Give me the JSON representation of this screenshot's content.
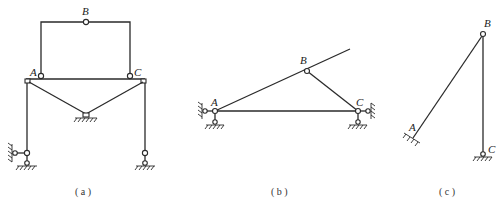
{
  "figures": [
    {
      "id": "a",
      "caption": "( a )",
      "labels": {
        "A": "A",
        "B": "B",
        "C": "C"
      },
      "description": "Frame with upper three-hinged arch on beam, two diagonal struts to central pin support, two columns on pinned supports"
    },
    {
      "id": "b",
      "caption": "( b )",
      "labels": {
        "A": "A",
        "B": "B",
        "C": "C"
      },
      "description": "Triangle linkage: bar A-B extended, link B-C, base A-C; pinned supports at A and C"
    },
    {
      "id": "c",
      "caption": "( c )",
      "labels": {
        "A": "A",
        "B": "B",
        "C": "C"
      },
      "description": "Inclined bar fixed at A hinged at B to vertical bar pinned at C"
    }
  ],
  "colors": {
    "line": "#2a2a2a",
    "background": "#ffffff"
  }
}
